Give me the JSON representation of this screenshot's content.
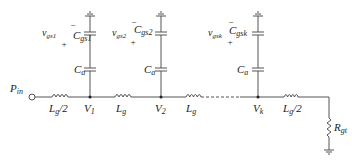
{
  "diagram": {
    "type": "circuit-schematic",
    "input_label": "P_in",
    "nodes": [
      {
        "id": "v1",
        "label_main": "V",
        "label_sub": "1"
      },
      {
        "id": "v2",
        "label_main": "V",
        "label_sub": "2"
      },
      {
        "id": "vk",
        "label_main": "V",
        "label_sub": "k"
      }
    ],
    "series_inductors": [
      {
        "label_main": "L",
        "label_sub": "g",
        "label_suffix": "/2"
      },
      {
        "label_main": "L",
        "label_sub": "g",
        "label_suffix": ""
      },
      {
        "label_main": "L",
        "label_sub": "g",
        "label_suffix": ""
      },
      {
        "label_main": "L",
        "label_sub": "g",
        "label_suffix": "/2"
      }
    ],
    "branches": [
      {
        "vgs_main": "v",
        "vgs_sub": "gs1",
        "cgs_main": "C",
        "cgs_sub": "gs1",
        "ca_main": "C",
        "ca_sub": "a",
        "minus": "−",
        "plus": "+"
      },
      {
        "vgs_main": "v",
        "vgs_sub": "gs2",
        "cgs_main": "C",
        "cgs_sub": "gs2",
        "ca_main": "C",
        "ca_sub": "a",
        "minus": "−",
        "plus": "+"
      },
      {
        "vgs_main": "v",
        "vgs_sub": "gsk",
        "cgs_main": "C",
        "cgs_sub": "gsk",
        "ca_main": "C",
        "ca_sub": "a",
        "minus": "−",
        "plus": "+"
      }
    ],
    "termination": {
      "label_main": "R",
      "label_sub": "gt"
    },
    "input": {
      "label_main": "P",
      "label_sub": "in"
    },
    "colors": {
      "wire": "#555555",
      "text": "#222222"
    }
  }
}
